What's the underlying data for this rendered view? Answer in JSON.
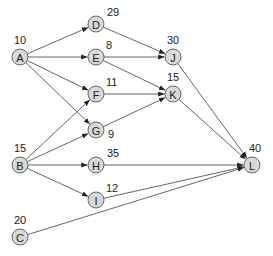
{
  "diagram": {
    "type": "directed-network",
    "node_radius": 8,
    "nodes": [
      {
        "id": "A",
        "label": "A",
        "value": "10",
        "x": 20,
        "y": 57,
        "vx": 14,
        "vy": 44
      },
      {
        "id": "B",
        "label": "B",
        "value": "15",
        "x": 20,
        "y": 165,
        "vx": 14,
        "vy": 152
      },
      {
        "id": "C",
        "label": "C",
        "value": "20",
        "x": 20,
        "y": 237,
        "vx": 14,
        "vy": 224
      },
      {
        "id": "D",
        "label": "D",
        "value": "29",
        "x": 96,
        "y": 24,
        "vx": 107,
        "vy": 16
      },
      {
        "id": "E",
        "label": "E",
        "value": "8",
        "x": 96,
        "y": 57,
        "vx": 106,
        "vy": 49
      },
      {
        "id": "F",
        "label": "F",
        "value": "11",
        "x": 96,
        "y": 94,
        "vx": 106,
        "vy": 86
      },
      {
        "id": "G",
        "label": "G",
        "value": "9",
        "x": 96,
        "y": 130,
        "vx": 108,
        "vy": 138
      },
      {
        "id": "H",
        "label": "H",
        "value": "35",
        "x": 96,
        "y": 165,
        "vx": 107,
        "vy": 157
      },
      {
        "id": "I",
        "label": "I",
        "value": "12",
        "x": 96,
        "y": 200,
        "vx": 106,
        "vy": 192
      },
      {
        "id": "J",
        "label": "J",
        "value": "30",
        "x": 173,
        "y": 57,
        "vx": 167,
        "vy": 44
      },
      {
        "id": "K",
        "label": "K",
        "value": "15",
        "x": 173,
        "y": 94,
        "vx": 167,
        "vy": 81
      },
      {
        "id": "L",
        "label": "L",
        "value": "40",
        "x": 252,
        "y": 165,
        "vx": 249,
        "vy": 152
      }
    ],
    "edges": [
      {
        "from": "A",
        "to": "D"
      },
      {
        "from": "A",
        "to": "E"
      },
      {
        "from": "A",
        "to": "F"
      },
      {
        "from": "A",
        "to": "G"
      },
      {
        "from": "B",
        "to": "F"
      },
      {
        "from": "B",
        "to": "G"
      },
      {
        "from": "B",
        "to": "H"
      },
      {
        "from": "B",
        "to": "I"
      },
      {
        "from": "D",
        "to": "J"
      },
      {
        "from": "E",
        "to": "J"
      },
      {
        "from": "E",
        "to": "K"
      },
      {
        "from": "F",
        "to": "K"
      },
      {
        "from": "G",
        "to": "K"
      },
      {
        "from": "J",
        "to": "L"
      },
      {
        "from": "K",
        "to": "L"
      },
      {
        "from": "H",
        "to": "L"
      },
      {
        "from": "I",
        "to": "L"
      },
      {
        "from": "C",
        "to": "L"
      }
    ],
    "colors": {
      "node_fill": "#d9d9d9",
      "node_stroke": "#666666",
      "edge": "#555555",
      "text": "#222222"
    }
  }
}
